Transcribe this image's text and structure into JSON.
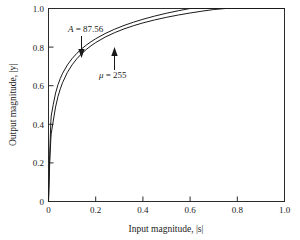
{
  "chart_data": {
    "type": "line",
    "title": "",
    "xlabel": "Input magnitude,  |s|",
    "ylabel": "Output magnitude,  |y|",
    "xlim": [
      0,
      1.0
    ],
    "ylim": [
      0,
      1.0
    ],
    "grid": false,
    "legend_position": "inline-annotations",
    "xticks": [
      "0",
      "0.2",
      "0.4",
      "0.6",
      "0.8",
      "1.0"
    ],
    "xtick_values": [
      0,
      0.2,
      0.4,
      0.6,
      0.8,
      1.0
    ],
    "yticks": [
      "0",
      "0.2",
      "0.4",
      "0.6",
      "0.8",
      "1.0"
    ],
    "ytick_values": [
      0,
      0.2,
      0.4,
      0.6,
      0.8,
      1.0
    ],
    "x": [
      0,
      0.005,
      0.01,
      0.0114,
      0.02,
      0.03,
      0.04,
      0.05,
      0.06,
      0.08,
      0.1,
      0.12,
      0.14,
      0.16,
      0.18,
      0.2,
      0.24,
      0.28,
      0.32,
      0.36,
      0.4,
      0.45,
      0.5,
      0.55,
      0.6,
      0.65,
      0.7,
      0.75,
      0.8,
      0.85,
      0.9,
      0.95,
      1.0
    ],
    "series": [
      {
        "name": "A = 87.56",
        "label": "A",
        "label_value": "87.56",
        "formula": "A-law companding",
        "values": [
          0,
          0.2421,
          0.4159,
          0.4424,
          0.5017,
          0.5619,
          0.6046,
          0.6377,
          0.6648,
          0.7075,
          0.7406,
          0.7676,
          0.7905,
          0.8103,
          0.8277,
          0.8433,
          0.8702,
          0.8927,
          0.9121,
          0.929,
          0.9441,
          0.9608,
          0.9755,
          0.9885,
          1.0,
          1.0,
          1.0,
          1.0,
          1.0,
          1.0,
          1.0,
          1.0,
          1.0
        ]
      },
      {
        "name": "mu = 255",
        "label": "μ",
        "label_value": "255",
        "formula": "mu-law companding",
        "values": [
          0,
          0.1985,
          0.3272,
          0.3505,
          0.417,
          0.49,
          0.5428,
          0.5838,
          0.6171,
          0.6688,
          0.7081,
          0.7395,
          0.7655,
          0.7876,
          0.8067,
          0.8235,
          0.8518,
          0.8748,
          0.8942,
          0.9108,
          0.9253,
          0.9409,
          0.9544,
          0.9662,
          0.9767,
          0.9861,
          0.9946,
          1.0,
          1.0,
          1.0,
          1.0,
          1.0,
          1.0
        ]
      }
    ],
    "annotations": [
      {
        "id": "a-law",
        "text_italic": "A",
        "text_rest": " = 87.56",
        "points_to_curve": "A = 87.56",
        "arrow_direction": "down",
        "arrow_x": 0.14,
        "arrow_y": 0.79
      },
      {
        "id": "mu-law",
        "text_italic": "μ",
        "text_rest": " = 255",
        "points_to_curve": "mu = 255",
        "arrow_direction": "up",
        "arrow_x": 0.28,
        "arrow_y": 0.875
      }
    ]
  }
}
